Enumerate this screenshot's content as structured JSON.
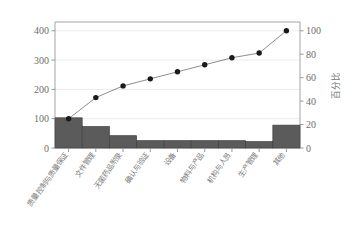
{
  "chart_data": {
    "type": "bar",
    "title": "",
    "subtitle": "",
    "xlabel": "",
    "ylabel": "",
    "y2label": "百分比",
    "categories": [
      "质量控制与质量保证",
      "文件管理",
      "无菌药品附录",
      "确认与验证",
      "设备",
      "物料与产品",
      "机构与人员",
      "生产管理",
      "其他"
    ],
    "values": [
      103,
      73,
      42,
      25,
      25,
      25,
      25,
      22,
      78
    ],
    "series": [
      {
        "name": "缺陷数",
        "type": "bar",
        "axis": "left",
        "values": [
          103,
          73,
          42,
          25,
          25,
          25,
          25,
          22,
          78
        ]
      },
      {
        "name": "累计百分比",
        "type": "line",
        "axis": "right",
        "values": [
          25,
          43,
          53,
          59,
          65,
          71,
          77,
          81,
          100
        ]
      }
    ],
    "yticks": [
      0,
      100,
      200,
      300,
      400
    ],
    "ylim": [
      0,
      430
    ],
    "y2ticks": [
      0,
      20,
      40,
      60,
      80,
      100
    ],
    "y2lim": [
      0,
      107.5
    ],
    "grid": true,
    "legend": false,
    "bar_color": "#5b5b5b",
    "line_color": "#707070",
    "marker_color": "#1a1a1a",
    "grid_color": "#e3e3ea",
    "axis_color": "#9a9a9a",
    "tick_text_color": "#6e6e6e",
    "label_text_color": "#7a7a7a"
  },
  "axes": {
    "left_ticks": [
      "400",
      "300",
      "200",
      "100",
      "0"
    ],
    "right_ticks": [
      "100",
      "80",
      "60",
      "40",
      "20",
      "0"
    ],
    "right_title": "百分比"
  }
}
